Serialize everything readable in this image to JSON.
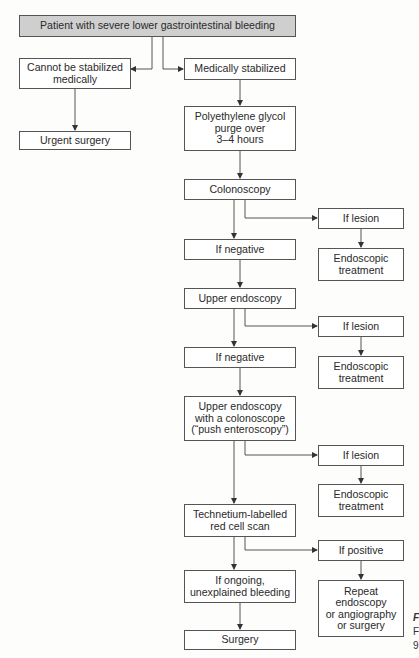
{
  "diagram": {
    "type": "flowchart",
    "title_node": "Patient with severe lower gastrointestinal bleeding",
    "nodes": {
      "start": "Patient with severe lower gastrointestinal bleeding",
      "unstable": "Cannot be stabilized\nmedically",
      "urgent_surgery": "Urgent surgery",
      "stabilized": "Medically stabilized",
      "peg_purge": "Polyethylene glycol\npurge over\n3–4 hours",
      "colonoscopy": "Colonoscopy",
      "lesion1": "If lesion",
      "treat1": "Endoscopic\ntreatment",
      "negative1": "If negative",
      "upper_endo": "Upper endoscopy",
      "lesion2": "If lesion",
      "treat2": "Endoscopic\ntreatment",
      "negative2": "If negative",
      "push_entero": "Upper endoscopy\nwith a colonoscope\n(“push enteroscopy”)",
      "lesion3": "If lesion",
      "treat3": "Endoscopic\ntreatment",
      "technetium": "Technetium-labelled\nred cell scan",
      "positive": "If positive",
      "repeat": "Repeat\nendoscopy\nor angiography\nor surgery",
      "ongoing": "If ongoing,\nunexplained bleeding",
      "surgery": "Surgery"
    },
    "edges": [
      [
        "start",
        "unstable"
      ],
      [
        "start",
        "stabilized"
      ],
      [
        "unstable",
        "urgent_surgery"
      ],
      [
        "stabilized",
        "peg_purge"
      ],
      [
        "peg_purge",
        "colonoscopy"
      ],
      [
        "colonoscopy",
        "lesion1"
      ],
      [
        "lesion1",
        "treat1"
      ],
      [
        "colonoscopy",
        "negative1"
      ],
      [
        "negative1",
        "upper_endo"
      ],
      [
        "upper_endo",
        "lesion2"
      ],
      [
        "lesion2",
        "treat2"
      ],
      [
        "upper_endo",
        "negative2"
      ],
      [
        "negative2",
        "push_entero"
      ],
      [
        "push_entero",
        "lesion3"
      ],
      [
        "lesion3",
        "treat3"
      ],
      [
        "push_entero",
        "technetium"
      ],
      [
        "technetium",
        "positive"
      ],
      [
        "positive",
        "repeat"
      ],
      [
        "technetium",
        "ongoing"
      ],
      [
        "ongoing",
        "surgery"
      ]
    ],
    "caption_fragments": [
      "F",
      "F",
      "9"
    ]
  }
}
